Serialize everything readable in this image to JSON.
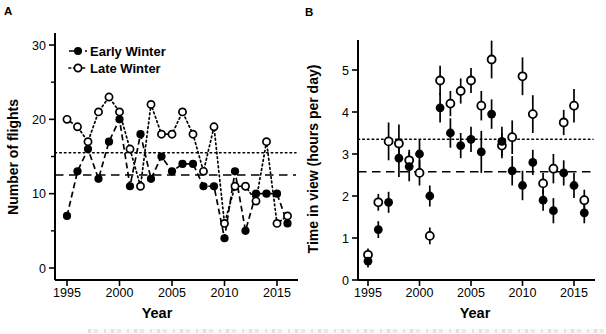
{
  "figure": {
    "background": "#ffffff",
    "ink_color": "#000000",
    "panel_a_label": "A",
    "panel_b_label": "B"
  },
  "chart_data": [
    {
      "panel_label": "A",
      "type": "line",
      "title": "",
      "xlabel": "Year",
      "ylabel": "Number of flights",
      "x": [
        1995,
        1996,
        1997,
        1998,
        1999,
        2000,
        2001,
        2002,
        2003,
        2004,
        2005,
        2006,
        2007,
        2008,
        2009,
        2010,
        2011,
        2012,
        2013,
        2014,
        2015,
        2016
      ],
      "xticks": [
        1995,
        2000,
        2005,
        2010,
        2015
      ],
      "ylim": [
        0,
        31.5
      ],
      "yticks": [
        0,
        10,
        20,
        30
      ],
      "yticks_minor": [
        5,
        15,
        25
      ],
      "grid": "off",
      "legend_position": "top-left",
      "series": [
        {
          "name": "Early Winter",
          "marker": "filled-circle",
          "line": "dashed",
          "values": [
            7,
            13,
            16,
            12,
            17,
            20,
            11,
            18,
            12,
            15,
            13,
            14,
            14,
            11,
            11,
            4,
            13,
            5,
            10,
            10,
            10,
            6
          ]
        },
        {
          "name": "Late Winter",
          "marker": "open-circle",
          "line": "dotted",
          "values": [
            20,
            19,
            17,
            21,
            23,
            21,
            16,
            11,
            22,
            18,
            18,
            21,
            18,
            13,
            19,
            6,
            11,
            11,
            9,
            17,
            6,
            7
          ]
        }
      ],
      "ref_lines": [
        {
          "style": "dotted",
          "value": 15.5
        },
        {
          "style": "dashed",
          "value": 12.5
        }
      ]
    },
    {
      "panel_label": "B",
      "type": "scatter",
      "title": "",
      "xlabel": "Year",
      "ylabel": "Time in view (hours per day)",
      "x": [
        1995,
        1996,
        1997,
        1998,
        1999,
        2000,
        2001,
        2002,
        2003,
        2004,
        2005,
        2006,
        2007,
        2008,
        2009,
        2010,
        2011,
        2012,
        2013,
        2014,
        2015,
        2016
      ],
      "xticks": [
        1995,
        2000,
        2005,
        2010,
        2015
      ],
      "ylim": [
        0,
        5.9
      ],
      "yticks": [
        0,
        1,
        2,
        3,
        4,
        5
      ],
      "grid": "off",
      "legend_position": "none",
      "series": [
        {
          "name": "Early Winter",
          "marker": "filled-circle",
          "line": "none",
          "values": [
            0.45,
            1.2,
            1.85,
            2.9,
            2.7,
            3.0,
            2.0,
            4.1,
            3.5,
            3.2,
            3.35,
            3.05,
            3.95,
            3.3,
            2.6,
            2.25,
            2.8,
            1.9,
            1.65,
            2.55,
            2.25,
            1.6
          ],
          "errors": [
            0.15,
            0.2,
            0.25,
            0.45,
            0.35,
            0.35,
            0.25,
            0.35,
            0.35,
            0.3,
            0.3,
            0.5,
            0.35,
            0.35,
            0.35,
            0.35,
            0.3,
            0.25,
            0.3,
            0.3,
            0.3,
            0.25
          ]
        },
        {
          "name": "Late Winter",
          "marker": "open-circle",
          "line": "none",
          "values": [
            0.6,
            1.85,
            3.3,
            3.25,
            2.85,
            2.55,
            1.05,
            4.75,
            4.2,
            4.5,
            4.75,
            4.15,
            5.25,
            3.2,
            3.4,
            4.85,
            3.95,
            2.3,
            2.65,
            3.75,
            4.15,
            1.9
          ],
          "errors": [
            0.15,
            0.2,
            0.45,
            0.45,
            0.25,
            0.3,
            0.2,
            0.35,
            0.3,
            0.3,
            0.3,
            0.35,
            0.45,
            0.3,
            0.4,
            0.45,
            0.45,
            0.25,
            0.35,
            0.3,
            0.4,
            0.25
          ]
        }
      ],
      "ref_lines": [
        {
          "style": "dotted",
          "value": 3.35
        },
        {
          "style": "dashed",
          "value": 2.58
        }
      ]
    }
  ]
}
